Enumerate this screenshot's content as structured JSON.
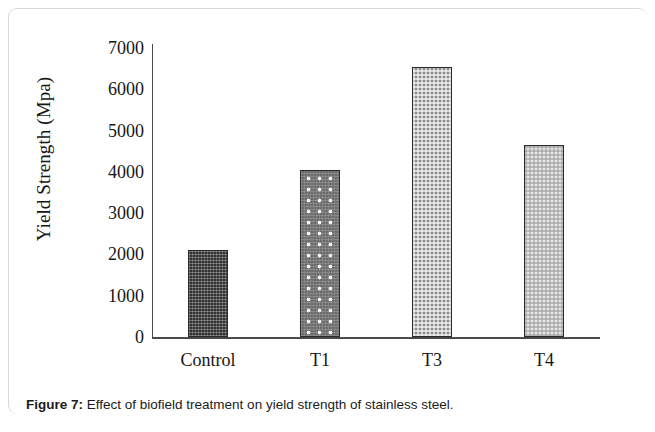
{
  "figure": {
    "caption_label": "Figure 7:",
    "caption_text": "Effect of biofield treatment on yield strength of stainless steel."
  },
  "chart_data": {
    "type": "bar",
    "title": "",
    "xlabel": "",
    "ylabel": "Yield Strength (Mpa)",
    "categories": [
      "Control",
      "T1",
      "T3",
      "T4"
    ],
    "values": [
      2100,
      4050,
      6550,
      4650
    ],
    "ylim": [
      0,
      7000
    ],
    "y_ticks": [
      0,
      1000,
      2000,
      3000,
      4000,
      5000,
      6000,
      7000
    ],
    "y_tick_labels": [
      "0",
      "1000",
      "2000",
      "3000",
      "4000",
      "5000",
      "6000",
      "7000"
    ],
    "grid": false,
    "legend": false,
    "legend_position": "none",
    "bar_styles": [
      {
        "category": "Control",
        "fill": "#323232",
        "pattern": "dense-weave"
      },
      {
        "category": "T1",
        "fill": "#6c6c6c",
        "pattern": "white-dots"
      },
      {
        "category": "T3",
        "fill": "#8d8d8d",
        "pattern": "checker"
      },
      {
        "category": "T4",
        "fill": "#e4e4e4",
        "pattern": "light-checker"
      }
    ],
    "axis_color": "#4a4a4a",
    "bar_outline_color": "#2a2a2a"
  }
}
